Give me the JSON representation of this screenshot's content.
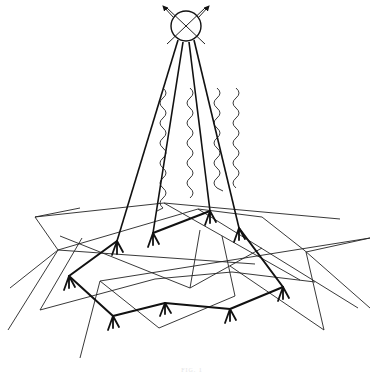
{
  "figure": {
    "type": "patent-style line drawing",
    "caption": "FIG. 1",
    "colors": {
      "line": "#111111",
      "background": "#ffffff"
    }
  },
  "elements": {
    "satellite": {
      "symbol": "circle-with-X",
      "arrows": 2
    },
    "beams": {
      "count": 4,
      "wavy_signals": 4
    },
    "network_nodes": {
      "count": 8,
      "symbol": "tripod-antenna"
    },
    "terrain_mesh": {
      "style": "thin wireframe polygons"
    }
  }
}
